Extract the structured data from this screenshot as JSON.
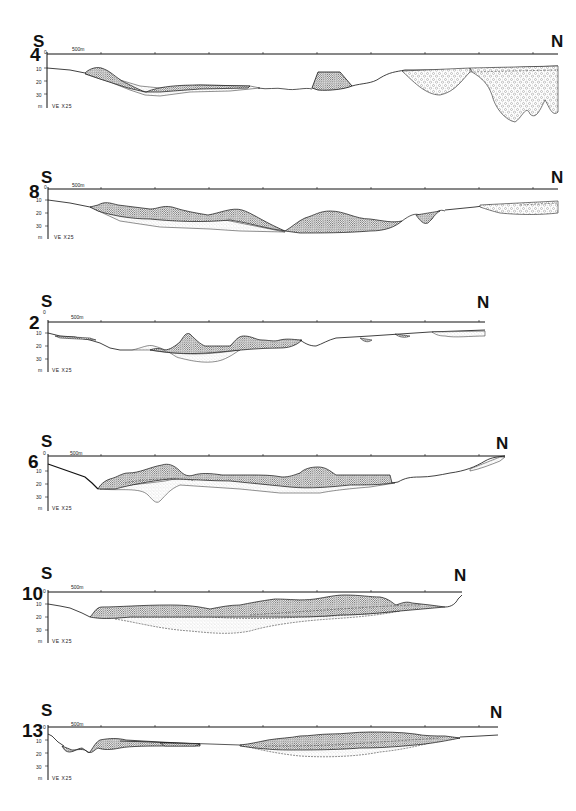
{
  "figure": {
    "type": "bathymetric cross-sections (seismic profiles)",
    "vertical_exaggeration": "VE X25",
    "scale_bar_label": "500m",
    "depth_unit": "m",
    "depth_ticks": [
      "0",
      "10",
      "20",
      "30"
    ],
    "left_direction": "S",
    "right_direction": "N",
    "colors": {
      "ink": "#111111",
      "background": "#ffffff",
      "stipple_dense": "#555555",
      "stipple_light": "#999999"
    }
  },
  "profiles": [
    {
      "id": "4",
      "label": "4",
      "south": "S",
      "north": "N",
      "scale": "500m",
      "ve": "VE X25",
      "unit": "m",
      "ticks": [
        "0",
        "10",
        "20",
        "30"
      ]
    },
    {
      "id": "8",
      "label": "8",
      "south": "S",
      "north": "N",
      "scale": "500m",
      "ve": "VE X25",
      "unit": "m",
      "ticks": [
        "0",
        "10",
        "20",
        "30"
      ]
    },
    {
      "id": "2",
      "label": "2",
      "south": "S",
      "north": "N",
      "scale": "500m",
      "ve": "VE X25",
      "unit": "m",
      "ticks": [
        "0",
        "10",
        "20",
        "30"
      ]
    },
    {
      "id": "6",
      "label": "6",
      "south": "S",
      "north": "N",
      "scale": "500m",
      "ve": "VE X25",
      "unit": "m",
      "ticks": [
        "0",
        "10",
        "20",
        "30"
      ]
    },
    {
      "id": "10",
      "label": "10",
      "south": "S",
      "north": "N",
      "scale": "500m",
      "ve": "VE X25",
      "unit": "m",
      "ticks": [
        "0",
        "10",
        "20",
        "30"
      ]
    },
    {
      "id": "13",
      "label": "13",
      "south": "S",
      "north": "N",
      "scale": "500m",
      "ve": "VE X25",
      "unit": "m",
      "ticks": [
        "0",
        "10",
        "20",
        "30"
      ]
    }
  ]
}
